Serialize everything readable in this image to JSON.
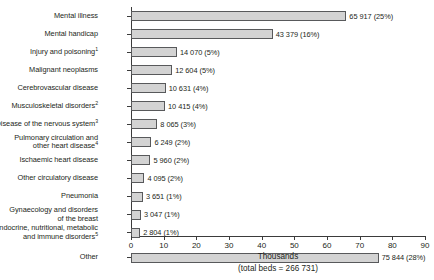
{
  "chart_data": {
    "type": "bar",
    "orientation": "horizontal",
    "title": "",
    "xlabel": "Thousands",
    "ylabel": "",
    "subtitle": "(total beds = 266 731)",
    "xlim": [
      0,
      90
    ],
    "xticks": [
      0,
      10,
      20,
      30,
      40,
      50,
      60,
      70,
      80,
      90
    ],
    "grid": false,
    "legend": false,
    "unit_scale": 1000,
    "categories": [
      "Mental illness",
      "Mental handicap",
      "Injury and poisoning",
      "Malignant neoplasms",
      "Cerebrovascular disease",
      "Musculoskeletal disorders",
      "Disease of the nervous system",
      "Pulmonary circulation and other heart disease",
      "Ischaemic heart disease",
      "Other circulatory disease",
      "Pneumonia",
      "Gynaecology and disorders of the breast",
      "Endocrine, nutritional, metabolic and immune disorders",
      "Other"
    ],
    "values": [
      65917,
      43379,
      14070,
      12604,
      10631,
      10415,
      8065,
      6249,
      5960,
      4095,
      3651,
      3047,
      2804,
      75844
    ],
    "percentages": [
      "25%",
      "16%",
      "5%",
      "5%",
      "4%",
      "4%",
      "3%",
      "2%",
      "2%",
      "2%",
      "1%",
      "1%",
      "1%",
      "28%"
    ],
    "colors": {
      "bar_fill": "#d3d3d3",
      "bar_border": "#58595b",
      "axis": "#3b3b3b",
      "text": "#231f20",
      "background": "#ffffff"
    }
  },
  "rows": [
    {
      "label_lines": [
        "Mental illness"
      ],
      "footnote": "",
      "value_label": "65 917 (25%)",
      "value": 65917
    },
    {
      "label_lines": [
        "Mental handicap"
      ],
      "footnote": "",
      "value_label": "43 379 (16%)",
      "value": 43379
    },
    {
      "label_lines": [
        "Injury and poisoning"
      ],
      "footnote": "1",
      "value_label": "14 070 (5%)",
      "value": 14070
    },
    {
      "label_lines": [
        "Malignant neoplasms"
      ],
      "footnote": "",
      "value_label": "12 604 (5%)",
      "value": 12604
    },
    {
      "label_lines": [
        "Cerebrovascular disease"
      ],
      "footnote": "",
      "value_label": "10 631 (4%)",
      "value": 10631
    },
    {
      "label_lines": [
        "Musculoskeletal disorders"
      ],
      "footnote": "2",
      "value_label": "10 415 (4%)",
      "value": 10415
    },
    {
      "label_lines": [
        "Disease of the nervous system"
      ],
      "footnote": "3",
      "value_label": "8 065 (3%)",
      "value": 8065
    },
    {
      "label_lines": [
        "Pulmonary circulation and",
        "other heart disease"
      ],
      "footnote": "4",
      "value_label": "6 249 (2%)",
      "value": 6249
    },
    {
      "label_lines": [
        "Ischaemic heart disease"
      ],
      "footnote": "",
      "value_label": "5 960 (2%)",
      "value": 5960
    },
    {
      "label_lines": [
        "Other circulatory disease"
      ],
      "footnote": "",
      "value_label": "4 095 (2%)",
      "value": 4095
    },
    {
      "label_lines": [
        "Pneumonia"
      ],
      "footnote": "",
      "value_label": "3 651 (1%)",
      "value": 3651
    },
    {
      "label_lines": [
        "Gynaecology and disorders",
        "of the breast"
      ],
      "footnote": "",
      "value_label": "3 047 (1%)",
      "value": 3047
    },
    {
      "label_lines": [
        "Endocrine, nutritional, metabolic",
        "and immune disorders"
      ],
      "footnote": "5",
      "value_label": "2 804 (1%)",
      "value": 2804
    },
    {
      "label_lines": [
        "Other"
      ],
      "footnote": "",
      "value_label": "75 844 (28%)",
      "value": 75844
    }
  ],
  "axis": {
    "ticks": [
      "0",
      "10",
      "20",
      "30",
      "40",
      "50",
      "60",
      "70",
      "80",
      "90"
    ],
    "title": "Thousands",
    "subtitle": "(total beds = 266 731)"
  }
}
